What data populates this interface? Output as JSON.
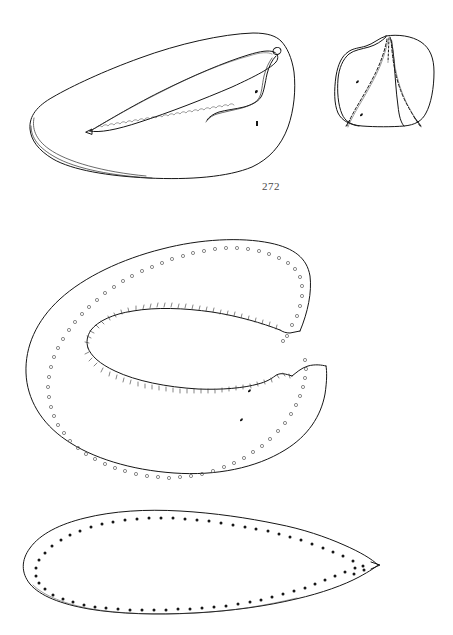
{
  "plate": {
    "title": "272",
    "background_color": "#ffffff",
    "ink_color": "#161616",
    "width": 453,
    "height": 635
  },
  "labels": [
    {
      "name": "figure-number-272",
      "text": "272",
      "x": 262,
      "y": 180
    }
  ],
  "figures": [
    {
      "id": "fig-upper-left-valve",
      "name": "upper-left-valve-lateral-view",
      "description": "Elongate valve in oblique lateral view with inner marginal groove and crenulate inner lamella",
      "bbox": [
        28,
        28,
        268,
        178
      ],
      "ornament": "crenulate-inner-margin",
      "interior_marks": 2
    },
    {
      "id": "fig-upper-right-section",
      "name": "upper-right-cross-section",
      "description": "Rounded sub-quadrate cross section divided into three chambers by dashed septa",
      "bbox": [
        334,
        33,
        102,
        96
      ],
      "ornament": "dashed-septa",
      "chambers": 3
    },
    {
      "id": "fig-middle-horseshoe",
      "name": "middle-horseshoe-valve",
      "description": "C-shaped horseshoe outline, open to the right; outer margin lined with small open circles (pore canals), inner margin with fine comb-like hatching",
      "bbox": [
        25,
        238,
        305,
        240
      ],
      "ornament": "open-circles-outer, comb-hatching-inner",
      "outer_circle_count": 74,
      "inner_hatch_count": 96
    },
    {
      "id": "fig-lower-leaf",
      "name": "lower-leaf-outline",
      "description": "Elongate leaf or teardrop outline with pointed right apex; rim lined with solid dark dots",
      "bbox": [
        25,
        508,
        360,
        105
      ],
      "ornament": "solid-dots-rim",
      "dot_count": 70
    }
  ]
}
